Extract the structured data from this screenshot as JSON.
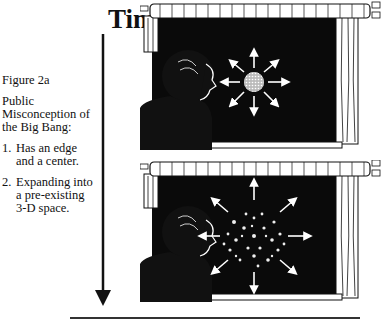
{
  "figure": {
    "label": "Figure 2a",
    "title": "Public Misconception of the Big Bang:",
    "points": [
      {
        "num": "1.",
        "text": "Has an edge and a center."
      },
      {
        "num": "2.",
        "text": "Expanding into a pre-existing 3-D space."
      }
    ]
  },
  "time_axis": {
    "label": "Time",
    "direction": "down"
  },
  "panels": [
    {
      "name": "early",
      "description": "Person at window watching a small dense ball of matter with 8 outward arrows against dark space"
    },
    {
      "name": "later",
      "description": "Person at window watching scattered dots spreading outward with 8 arrows against dark space"
    }
  ],
  "colors": {
    "ink": "#111111",
    "paper": "#ffffff",
    "space": "#0a0a0a"
  }
}
